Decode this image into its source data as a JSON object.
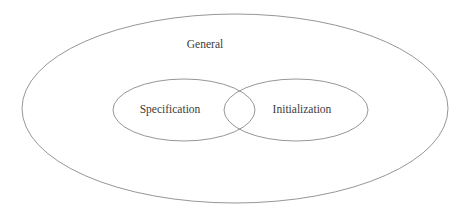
{
  "diagram": {
    "type": "venn-diagram",
    "background_color": "#ffffff",
    "stroke_color": "#8a8a8a",
    "text_color": "#3b3b3b",
    "sets": [
      {
        "id": "general",
        "label": "General",
        "role": "universal-set",
        "shape": "ellipse",
        "cx": 235,
        "cy": 108.5,
        "rx": 213,
        "ry": 94.5,
        "label_x": 205,
        "label_y": 45
      },
      {
        "id": "specification",
        "label": "Specification",
        "role": "subset",
        "shape": "ellipse",
        "cx": 184,
        "cy": 110,
        "rx": 71,
        "ry": 31,
        "label_x": 170,
        "label_y": 110
      },
      {
        "id": "initialization",
        "label": "Initialization",
        "role": "subset",
        "shape": "ellipse",
        "cx": 296,
        "cy": 110,
        "rx": 72,
        "ry": 31,
        "label_x": 302,
        "label_y": 110
      }
    ],
    "intersection": {
      "id": "specification-initialization-overlap",
      "between": [
        "specification",
        "initialization"
      ],
      "label": ""
    }
  }
}
